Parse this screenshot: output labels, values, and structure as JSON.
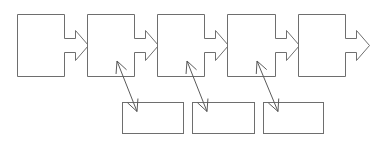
{
  "diagram": {
    "type": "flow",
    "stroke_color": "#6e6e6e",
    "background": "#ffffff",
    "chevron_boxes": [
      {
        "id": "step-1",
        "x": 17,
        "y": 14,
        "w": 47,
        "h": 62,
        "label": ""
      },
      {
        "id": "step-2",
        "x": 87,
        "y": 14,
        "w": 47,
        "h": 62,
        "label": ""
      },
      {
        "id": "step-3",
        "x": 157,
        "y": 14,
        "w": 47,
        "h": 62,
        "label": ""
      },
      {
        "id": "step-4",
        "x": 227,
        "y": 14,
        "w": 48,
        "h": 62,
        "label": ""
      },
      {
        "id": "step-5",
        "x": 298,
        "y": 14,
        "w": 47,
        "h": 62,
        "label": ""
      }
    ],
    "sub_boxes": [
      {
        "id": "detail-1",
        "x": 122,
        "y": 102,
        "w": 61,
        "h": 31,
        "label": ""
      },
      {
        "id": "detail-2",
        "x": 192,
        "y": 102,
        "w": 62,
        "h": 31,
        "label": ""
      },
      {
        "id": "detail-3",
        "x": 263,
        "y": 102,
        "w": 60,
        "h": 31,
        "label": ""
      }
    ],
    "connectors": [
      {
        "from": "step-2",
        "to": "detail-1",
        "style": "double-arrow"
      },
      {
        "from": "step-3",
        "to": "detail-2",
        "style": "double-arrow"
      },
      {
        "from": "step-4",
        "to": "detail-3",
        "style": "double-arrow"
      }
    ]
  }
}
